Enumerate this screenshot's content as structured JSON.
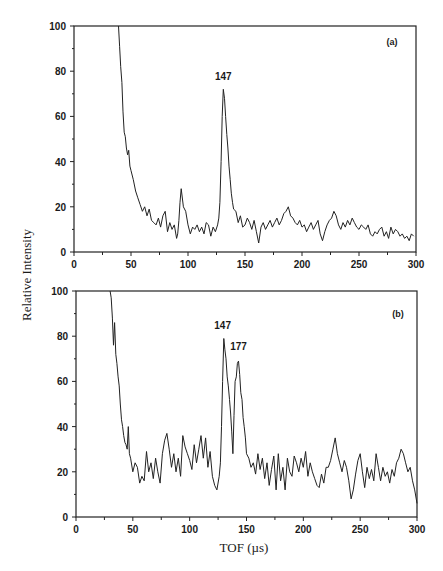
{
  "figure": {
    "ylabel": "Relative Intensity",
    "xlabel": "TOF (µs)",
    "line_color": "#222222",
    "axis_color": "#222222"
  },
  "chart_data": [
    {
      "type": "line",
      "panel": "(a)",
      "title": "",
      "xlabel": "TOF (µs)",
      "ylabel": "Relative Intensity",
      "xlim": [
        0,
        300
      ],
      "ylim": [
        0,
        100
      ],
      "xticks": [
        0,
        50,
        100,
        150,
        200,
        250,
        300
      ],
      "yticks": [
        0,
        20,
        40,
        60,
        80,
        100
      ],
      "grid": false,
      "annotations": [
        {
          "text": "147",
          "x": 131,
          "y": 76
        }
      ],
      "series": [
        {
          "name": "spectrum (a)",
          "x": [
            39,
            40,
            41,
            42,
            43,
            44,
            45,
            46,
            47,
            48,
            49,
            50,
            52,
            54,
            56,
            58,
            60,
            62,
            64,
            66,
            68,
            70,
            72,
            74,
            76,
            78,
            80,
            82,
            84,
            86,
            88,
            90,
            91,
            92,
            93,
            94,
            96,
            98,
            100,
            102,
            104,
            106,
            108,
            110,
            112,
            114,
            116,
            118,
            120,
            122,
            124,
            126,
            127,
            128,
            129,
            130,
            131,
            132,
            133,
            134,
            135,
            136,
            137,
            138,
            139,
            140,
            142,
            144,
            146,
            148,
            150,
            152,
            154,
            156,
            158,
            160,
            162,
            164,
            166,
            168,
            170,
            172,
            174,
            176,
            178,
            180,
            182,
            184,
            186,
            188,
            190,
            192,
            194,
            196,
            198,
            200,
            202,
            204,
            206,
            208,
            210,
            212,
            214,
            216,
            218,
            220,
            222,
            224,
            226,
            228,
            230,
            232,
            234,
            236,
            238,
            240,
            242,
            244,
            246,
            248,
            250,
            252,
            254,
            256,
            258,
            260,
            262,
            264,
            266,
            268,
            270,
            272,
            274,
            276,
            278,
            280,
            282,
            284,
            286,
            288,
            290,
            292,
            294,
            296,
            298,
            300
          ],
          "values": [
            100,
            91,
            82,
            75,
            62,
            53,
            51,
            46,
            43,
            45,
            38,
            36,
            32,
            27,
            24,
            21,
            18,
            20,
            16,
            19,
            14,
            13,
            12,
            15,
            11,
            16,
            18,
            9,
            13,
            10,
            12,
            6,
            8,
            14,
            22,
            28,
            20,
            18,
            12,
            8,
            11,
            10,
            12,
            9,
            11,
            8,
            13,
            12,
            7,
            11,
            9,
            12,
            15,
            22,
            40,
            60,
            72,
            68,
            60,
            52,
            46,
            38,
            32,
            26,
            22,
            19,
            18,
            13,
            16,
            11,
            12,
            15,
            13,
            10,
            14,
            9,
            4,
            11,
            13,
            10,
            12,
            14,
            11,
            13,
            15,
            12,
            14,
            17,
            18,
            20,
            16,
            15,
            13,
            12,
            14,
            11,
            12,
            9,
            11,
            13,
            10,
            12,
            14,
            8,
            5,
            9,
            12,
            14,
            15,
            18,
            16,
            12,
            10,
            13,
            11,
            14,
            12,
            15,
            13,
            11,
            10,
            12,
            11,
            10,
            12,
            8,
            7,
            9,
            8,
            10,
            11,
            7,
            9,
            6,
            11,
            8,
            10,
            9,
            7,
            8,
            6,
            7,
            5,
            8,
            7
          ],
          "peaks": [
            {
              "label": "147",
              "x": 131,
              "y": 72
            }
          ]
        }
      ]
    },
    {
      "type": "line",
      "panel": "(b)",
      "title": "",
      "xlabel": "TOF (µs)",
      "ylabel": "Relative Intensity",
      "xlim": [
        0,
        300
      ],
      "ylim": [
        0,
        100
      ],
      "xticks": [
        0,
        50,
        100,
        150,
        200,
        250,
        300
      ],
      "yticks": [
        0,
        20,
        40,
        60,
        80,
        100
      ],
      "grid": false,
      "annotations": [
        {
          "text": "147",
          "x": 129,
          "y": 83
        },
        {
          "text": "177",
          "x": 143,
          "y": 74
        }
      ],
      "series": [
        {
          "name": "spectrum (b)",
          "x": [
            30,
            31,
            32,
            33,
            34,
            35,
            36,
            37,
            38,
            39,
            40,
            41,
            42,
            43,
            44,
            45,
            46,
            47,
            48,
            50,
            52,
            54,
            56,
            58,
            60,
            62,
            64,
            66,
            68,
            70,
            72,
            74,
            76,
            78,
            80,
            82,
            84,
            86,
            88,
            90,
            92,
            94,
            96,
            98,
            100,
            102,
            104,
            106,
            108,
            110,
            112,
            114,
            116,
            118,
            120,
            122,
            124,
            126,
            127,
            128,
            129,
            130,
            131,
            132,
            133,
            134,
            135,
            136,
            137,
            138,
            139,
            140,
            141,
            142,
            143,
            144,
            145,
            146,
            147,
            148,
            149,
            150,
            152,
            154,
            156,
            158,
            160,
            162,
            164,
            166,
            168,
            170,
            172,
            174,
            176,
            178,
            180,
            182,
            184,
            186,
            188,
            190,
            192,
            194,
            196,
            198,
            200,
            202,
            204,
            206,
            208,
            210,
            212,
            214,
            216,
            218,
            220,
            222,
            224,
            226,
            228,
            230,
            232,
            234,
            236,
            238,
            240,
            242,
            244,
            246,
            248,
            250,
            252,
            254,
            256,
            258,
            260,
            262,
            264,
            266,
            268,
            270,
            272,
            274,
            276,
            278,
            280,
            282,
            284,
            286,
            288,
            290,
            292,
            294,
            296,
            298,
            300
          ],
          "values": [
            100,
            97,
            88,
            76,
            86,
            72,
            68,
            62,
            58,
            50,
            43,
            40,
            36,
            33,
            32,
            30,
            40,
            28,
            26,
            20,
            24,
            22,
            15,
            18,
            16,
            29,
            20,
            24,
            17,
            26,
            20,
            15,
            28,
            34,
            37,
            30,
            22,
            28,
            20,
            26,
            18,
            36,
            31,
            28,
            25,
            21,
            32,
            24,
            30,
            36,
            26,
            35,
            22,
            29,
            18,
            14,
            12,
            18,
            24,
            40,
            60,
            79,
            74,
            70,
            62,
            58,
            52,
            46,
            38,
            28,
            45,
            60,
            62,
            68,
            69,
            63,
            55,
            52,
            44,
            40,
            35,
            28,
            26,
            22,
            24,
            19,
            28,
            21,
            26,
            17,
            24,
            14,
            21,
            27,
            12,
            28,
            16,
            22,
            12,
            26,
            20,
            18,
            27,
            24,
            20,
            26,
            22,
            29,
            18,
            24,
            20,
            17,
            14,
            13,
            19,
            15,
            22,
            22,
            25,
            30,
            35,
            28,
            24,
            20,
            25,
            22,
            16,
            8,
            12,
            19,
            25,
            28,
            20,
            13,
            22,
            17,
            21,
            16,
            28,
            22,
            16,
            22,
            18,
            20,
            15,
            21,
            18,
            24,
            26,
            30,
            28,
            24,
            20,
            22,
            16,
            12,
            6
          ],
          "peaks": [
            {
              "label": "147",
              "x": 128,
              "y": 79
            },
            {
              "label": "177",
              "x": 143,
              "y": 69
            }
          ]
        }
      ]
    }
  ]
}
